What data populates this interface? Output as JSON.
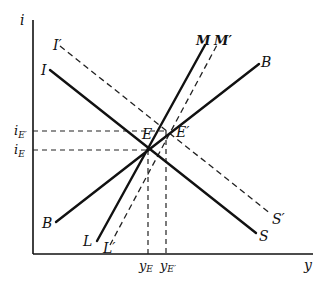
{
  "diagram": {
    "axes": {
      "x_label": "y",
      "y_label": "i"
    },
    "curves": {
      "I": {
        "label": "I",
        "style": "solid"
      },
      "I_prime": {
        "label": "I′",
        "style": "dashed"
      },
      "S": {
        "label": "S",
        "style": "solid"
      },
      "S_prime": {
        "label": "S′",
        "style": "dashed"
      },
      "M": {
        "label": "M",
        "style": "solid"
      },
      "M_prime": {
        "label": "M′",
        "style": "dashed"
      },
      "L": {
        "label": "L",
        "style": "solid"
      },
      "L_prime": {
        "label": "L′",
        "style": "dashed"
      },
      "B_upper": {
        "label": "B",
        "style": "solid"
      },
      "B_lower": {
        "label": "B",
        "style": "solid"
      }
    },
    "points": {
      "E": {
        "label": "E"
      },
      "E_prime": {
        "label": "E′"
      }
    },
    "ticks": {
      "i_E": {
        "main": "i",
        "sub": "E"
      },
      "i_E_prime": {
        "main": "i",
        "sub": "E′"
      },
      "y_E": {
        "main": "y",
        "sub": "E"
      },
      "y_E_prime": {
        "main": "y",
        "sub": "E′"
      }
    }
  }
}
